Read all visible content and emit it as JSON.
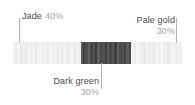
{
  "chart_data": {
    "type": "bar",
    "title": "",
    "xlabel": "",
    "ylabel": "",
    "orientation": "horizontal-stacked-striped",
    "categories": [
      "Jade",
      "Dark green",
      "Pale gold"
    ],
    "values": [
      40,
      30,
      30
    ],
    "value_labels": [
      "40%",
      "30%",
      "30%"
    ],
    "unit": "%",
    "total": 100,
    "grid": false,
    "legend": "callout-leader-lines",
    "segments": [
      {
        "name": "Jade",
        "percent_label": "40%",
        "percent_value": 40,
        "swatch": "#f0f0f0",
        "stripe_colors": [
          "#f3f3f3",
          "#ededed",
          "#f5f5f5",
          "#e9e9e9",
          "#f1f1f1",
          "#ebebeb",
          "#f4f4f4",
          "#eeeeee",
          "#f2f2f2",
          "#e8e8e8",
          "#f0f0f0",
          "#f5f5f5",
          "#ececec",
          "#f2f2f2",
          "#eaeaea",
          "#f4f4f4",
          "#efefef",
          "#f1f1f1",
          "#e9e9e9",
          "#f3f3f3",
          "#edeeed",
          "#f5f5f5",
          "#ebebeb",
          "#f0f0f0",
          "#f2f2f2",
          "#e8e8e8",
          "#f4f4f4",
          "#eeeeee"
        ]
      },
      {
        "name": "Dark green",
        "percent_label": "30%",
        "percent_value": 30,
        "swatch": "#4d4d4d",
        "stripe_colors": [
          "#595959",
          "#3f3f3f",
          "#4e4e4e",
          "#626262",
          "#454545",
          "#545454",
          "#3b3b3b",
          "#5d5d5d",
          "#484848",
          "#505050",
          "#404040",
          "#5a5a5a",
          "#464646",
          "#565656",
          "#3d3d3d",
          "#606060",
          "#4a4a4a",
          "#525252",
          "#424242",
          "#5c5c5c",
          "#474747"
        ]
      },
      {
        "name": "Pale gold",
        "percent_label": "30%",
        "percent_value": 30,
        "swatch": "#efefef",
        "stripe_colors": [
          "#f2f2f2",
          "#ebebeb",
          "#f5f5f5",
          "#eeeeee",
          "#f0f0f0",
          "#e9e9e9",
          "#f4f4f4",
          "#ededed",
          "#f1f1f1",
          "#eaeaea",
          "#f3f3f3",
          "#efefef",
          "#f5f5f5",
          "#ececec",
          "#f2f2f2",
          "#e8e8e8",
          "#f0f0f0",
          "#f4f4f4",
          "#ebebeb",
          "#f1f1f1",
          "#eeeeee"
        ]
      }
    ]
  },
  "callouts": {
    "jade": {
      "name": "Jade",
      "percent": "40%"
    },
    "pale_gold": {
      "name": "Pale gold",
      "percent": "30%"
    },
    "dark_green": {
      "name": "Dark green",
      "percent": "30%"
    }
  },
  "colors": {
    "background": "#ffffff",
    "label_text": "#4a4a4a",
    "percent_text": "#a3a3a3",
    "leader_line": "#b4b4b4"
  }
}
